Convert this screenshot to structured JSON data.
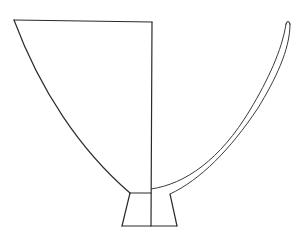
{
  "diagram": {
    "colors": {
      "background": "#ffffff",
      "line": "#2a2a2a"
    },
    "parts": [
      {
        "name": "left-exterior-half"
      },
      {
        "name": "right-section-wall"
      },
      {
        "name": "foot"
      },
      {
        "name": "center-axis"
      }
    ]
  }
}
